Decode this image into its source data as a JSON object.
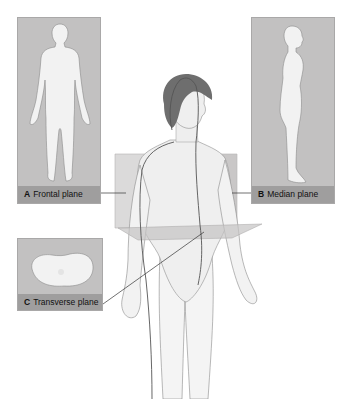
{
  "figure": {
    "panels": [
      {
        "letter": "A",
        "label": "Frontal plane"
      },
      {
        "letter": "B",
        "label": "Median plane"
      },
      {
        "letter": "C",
        "label": "Transverse plane"
      }
    ]
  },
  "colors": {
    "panel_bg": "#c2c1c1",
    "label_bar": "#9f9e9e",
    "plane_fill": "#c8c7c7",
    "hair": "#6e6e6e",
    "body_outline": "#5a5a5a",
    "leader_line": "#333333"
  }
}
